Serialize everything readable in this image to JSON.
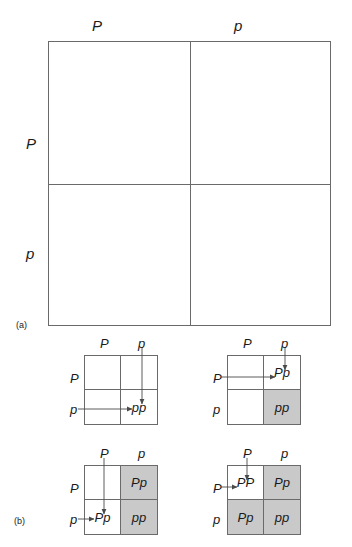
{
  "figure": {
    "panels": [
      {
        "letter": "(a)",
        "column_headers": [
          "P",
          "p"
        ],
        "row_headers": [
          "P",
          "p"
        ],
        "cells": [
          "",
          "",
          "",
          ""
        ]
      },
      {
        "letter": "(b)",
        "squares": [
          {
            "name": "step-1",
            "column_headers": [
              "P",
              "p"
            ],
            "row_headers": [
              "P",
              "p"
            ],
            "cells": [
              {
                "label": "",
                "shaded": false
              },
              {
                "label": "",
                "shaded": false
              },
              {
                "label": "",
                "shaded": false
              },
              {
                "label": "pp",
                "shaded": false
              }
            ],
            "arrows": [
              "top-p-down-to-bottom-right",
              "left-p-right-to-bottom-right"
            ]
          },
          {
            "name": "step-2",
            "column_headers": [
              "P",
              "p"
            ],
            "row_headers": [
              "P",
              "p"
            ],
            "cells": [
              {
                "label": "",
                "shaded": false
              },
              {
                "label": "Pp",
                "shaded": false
              },
              {
                "label": "",
                "shaded": false
              },
              {
                "label": "pp",
                "shaded": true
              }
            ],
            "arrows": [
              "top-p-down-to-top-right",
              "left-P-right-to-top-right"
            ]
          },
          {
            "name": "step-3",
            "column_headers": [
              "P",
              "p"
            ],
            "row_headers": [
              "P",
              "p"
            ],
            "cells": [
              {
                "label": "",
                "shaded": false
              },
              {
                "label": "Pp",
                "shaded": true
              },
              {
                "label": "Pp",
                "shaded": false
              },
              {
                "label": "pp",
                "shaded": true
              }
            ],
            "arrows": [
              "top-P-down-to-bottom-left",
              "left-p-right-to-bottom-left"
            ]
          },
          {
            "name": "step-4",
            "column_headers": [
              "P",
              "p"
            ],
            "row_headers": [
              "P",
              "p"
            ],
            "cells": [
              {
                "label": "PP",
                "shaded": false
              },
              {
                "label": "Pp",
                "shaded": true
              },
              {
                "label": "Pp",
                "shaded": true
              },
              {
                "label": "pp",
                "shaded": true
              }
            ],
            "arrows": [
              "top-P-down-to-top-left",
              "left-P-right-to-top-left"
            ]
          }
        ]
      }
    ],
    "colors": {
      "line": "#6a6a6a",
      "shade": "#c9c9c9",
      "text": "#1a1a1a",
      "background": "#ffffff"
    }
  }
}
